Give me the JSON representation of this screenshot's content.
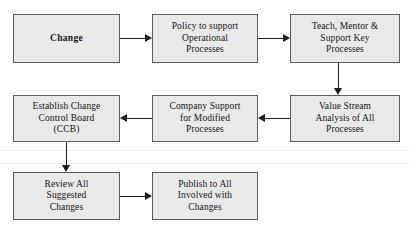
{
  "diagram": {
    "background_color": "#ffffff",
    "node_fill_color": "#e9e9e9",
    "node_border_color": "#5d5d5d",
    "connector_color": "#1b1b1b",
    "nodes": [
      {
        "id": "change",
        "label": "Change",
        "emphasis": true
      },
      {
        "id": "policy",
        "label": "Policy to support\nOperational\nProcesses",
        "emphasis": false
      },
      {
        "id": "teach",
        "label": "Teach, Mentor &\nSupport Key\nProcesses",
        "emphasis": false
      },
      {
        "id": "establish-ccb",
        "label": "Establish Change\nControl Board\n(CCB)",
        "emphasis": false
      },
      {
        "id": "company-support",
        "label": "Company Support\nfor Modified\nProcesses",
        "emphasis": false
      },
      {
        "id": "value-stream",
        "label": "Value Stream\nAnalysis of All\nProcesses",
        "emphasis": false
      },
      {
        "id": "review",
        "label": "Review All\nSuggested\nChanges",
        "emphasis": false
      },
      {
        "id": "publish",
        "label": "Publish to All\nInvolved with\nChanges",
        "emphasis": false
      }
    ],
    "connectors": [
      {
        "id": "change-to-policy",
        "from": "change",
        "to": "policy",
        "direction": "right"
      },
      {
        "id": "policy-to-teach",
        "from": "policy",
        "to": "teach",
        "direction": "right"
      },
      {
        "id": "teach-to-value-stream",
        "from": "teach",
        "to": "value-stream",
        "direction": "down"
      },
      {
        "id": "value-stream-to-company-support",
        "from": "value-stream",
        "to": "company-support",
        "direction": "left"
      },
      {
        "id": "company-support-to-establish-ccb",
        "from": "company-support",
        "to": "establish-ccb",
        "direction": "left"
      },
      {
        "id": "establish-ccb-to-review",
        "from": "establish-ccb",
        "to": "review",
        "direction": "down"
      },
      {
        "id": "review-to-publish",
        "from": "review",
        "to": "publish",
        "direction": "right"
      }
    ]
  }
}
